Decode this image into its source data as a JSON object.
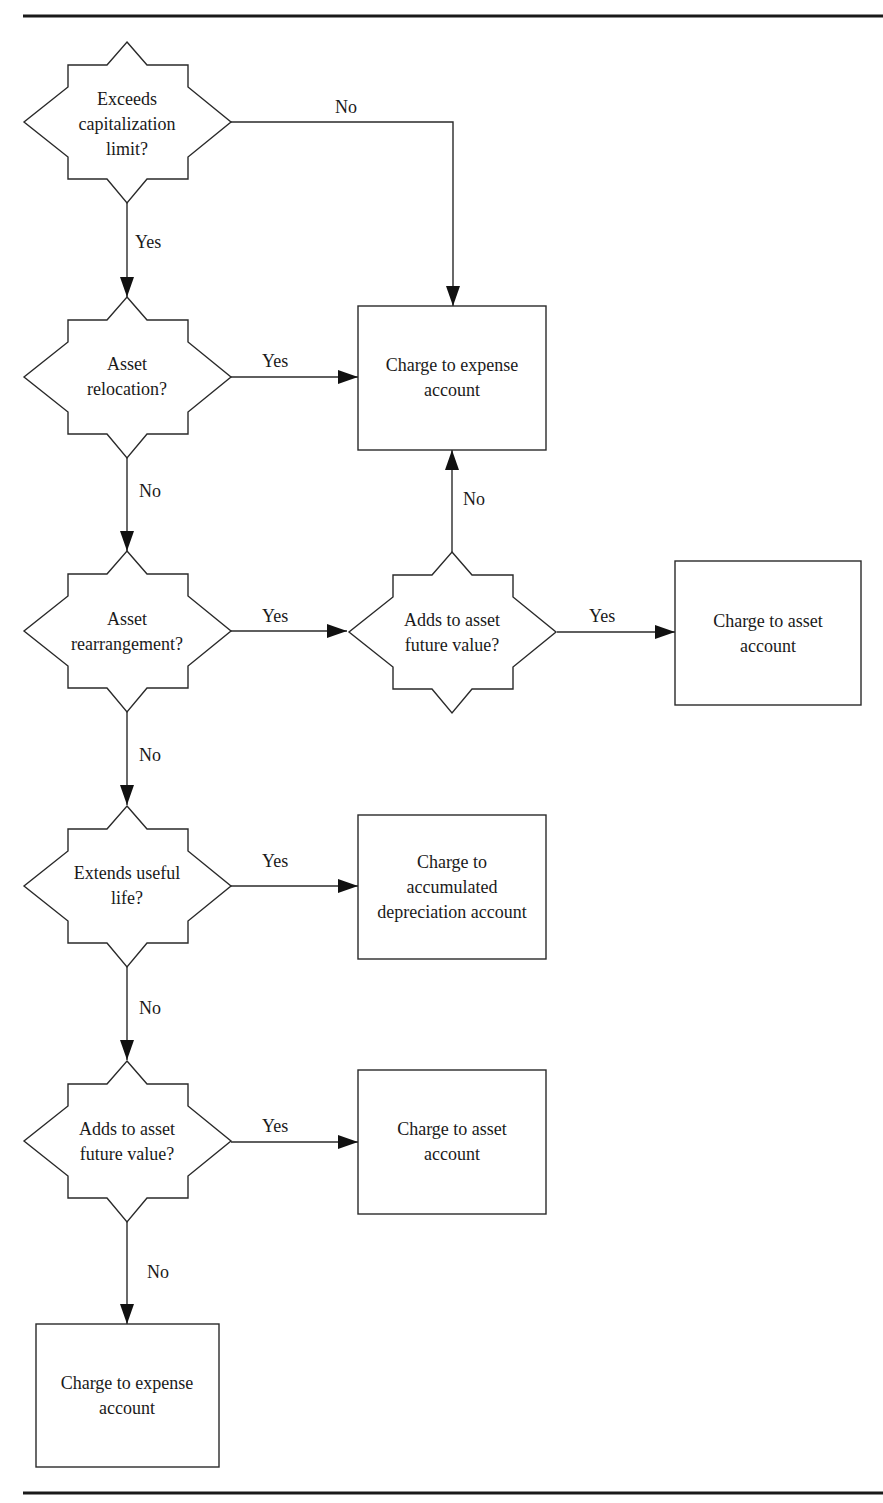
{
  "diagram": {
    "type": "flowchart",
    "decisions": [
      {
        "id": "d1",
        "lines": [
          "Exceeds",
          "capitalization",
          "limit?"
        ],
        "cx": 127,
        "cy": 122
      },
      {
        "id": "d2",
        "lines": [
          "Asset",
          "relocation?"
        ],
        "cx": 127,
        "cy": 377
      },
      {
        "id": "d3",
        "lines": [
          "Asset",
          "rearrangement?"
        ],
        "cx": 127,
        "cy": 631
      },
      {
        "id": "d4",
        "lines": [
          "Adds to asset",
          "future value?"
        ],
        "cx": 452,
        "cy": 632
      },
      {
        "id": "d5",
        "lines": [
          "Extends useful",
          "life?"
        ],
        "cx": 127,
        "cy": 886
      },
      {
        "id": "d6",
        "lines": [
          "Adds to asset",
          "future value?"
        ],
        "cx": 127,
        "cy": 1141
      }
    ],
    "outcomes": [
      {
        "id": "b1",
        "lines": [
          "Charge to expense",
          "account"
        ],
        "x": 358,
        "y": 306,
        "w": 188,
        "h": 144
      },
      {
        "id": "b2",
        "lines": [
          "Charge to asset",
          "account"
        ],
        "x": 675,
        "y": 561,
        "w": 186,
        "h": 144
      },
      {
        "id": "b3",
        "lines": [
          "Charge to",
          "accumulated",
          "depreciation account"
        ],
        "x": 358,
        "y": 815,
        "w": 188,
        "h": 144
      },
      {
        "id": "b4",
        "lines": [
          "Charge to asset",
          "account"
        ],
        "x": 358,
        "y": 1070,
        "w": 188,
        "h": 144
      },
      {
        "id": "b5",
        "lines": [
          "Charge to expense",
          "account"
        ],
        "x": 36,
        "y": 1324,
        "w": 183,
        "h": 143
      }
    ],
    "edges": [
      {
        "from": "d1",
        "to": "b1",
        "label": "No"
      },
      {
        "from": "d1",
        "to": "d2",
        "label": "Yes"
      },
      {
        "from": "d2",
        "to": "b1",
        "label": "Yes"
      },
      {
        "from": "d2",
        "to": "d3",
        "label": "No"
      },
      {
        "from": "d3",
        "to": "d4",
        "label": "Yes"
      },
      {
        "from": "d4",
        "to": "b1",
        "label": "No"
      },
      {
        "from": "d4",
        "to": "b2",
        "label": "Yes"
      },
      {
        "from": "d3",
        "to": "d5",
        "label": "No"
      },
      {
        "from": "d5",
        "to": "b3",
        "label": "Yes"
      },
      {
        "from": "d5",
        "to": "d6",
        "label": "No"
      },
      {
        "from": "d6",
        "to": "b4",
        "label": "Yes"
      },
      {
        "from": "d6",
        "to": "b5",
        "label": "No"
      }
    ],
    "edge_labels": {
      "d1_no": "No",
      "d1_yes": "Yes",
      "d2_yes": "Yes",
      "d2_no": "No",
      "d3_yes": "Yes",
      "d3_no": "No",
      "d4_no": "No",
      "d4_yes": "Yes",
      "d5_yes": "Yes",
      "d5_no": "No",
      "d6_yes": "Yes",
      "d6_no": "No"
    },
    "colors": {
      "stroke": "#2a2a2a",
      "background": "#ffffff",
      "text": "#1a1a1a"
    }
  }
}
